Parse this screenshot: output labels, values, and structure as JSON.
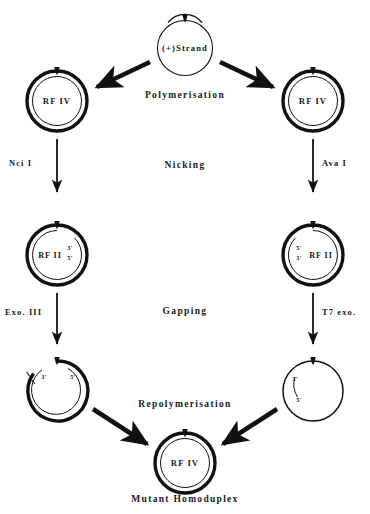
{
  "figure": {
    "caption": "Mutant  Homoduplex",
    "colors": {
      "ink": "#111111",
      "background": "#ffffff"
    }
  },
  "nodes": {
    "top_strand": {
      "label": "(+)Strand",
      "ends": []
    },
    "rf4_left": {
      "label": "RF  IV",
      "ends": []
    },
    "rf4_right": {
      "label": "RF  IV",
      "ends": []
    },
    "rf2_left": {
      "label": "RF  II",
      "ends": [
        "3'",
        "5'"
      ]
    },
    "rf2_right": {
      "label": "RF  II",
      "ends": [
        "5'",
        "3'"
      ]
    },
    "gapped_left": {
      "label": "",
      "ends": [
        "3'",
        "5'"
      ]
    },
    "gapped_right": {
      "label": "",
      "ends": [
        "3'",
        "5'"
      ]
    },
    "rf4_bottom": {
      "label": "RF  IV",
      "ends": []
    }
  },
  "stages": [
    {
      "name": "Polymerisation"
    },
    {
      "name": "Nicking"
    },
    {
      "name": "Gapping"
    },
    {
      "name": "Repolymerisation"
    }
  ],
  "enzymes": [
    {
      "name": "Nci  I",
      "side": "left",
      "step": "nicking"
    },
    {
      "name": "Ava  I",
      "side": "right",
      "step": "nicking"
    },
    {
      "name": "Exo.  III",
      "side": "left",
      "step": "gapping"
    },
    {
      "name": "T7  exo.",
      "side": "right",
      "step": "gapping"
    }
  ],
  "end_labels": {
    "rf2_left_3": "3'",
    "rf2_left_5": "5'",
    "rf2_right_5": "5'",
    "rf2_right_3": "3'",
    "gapped_left_3": "3'",
    "gapped_left_5": "5'",
    "gapped_right_3": "3'",
    "gapped_right_5": "5'"
  }
}
